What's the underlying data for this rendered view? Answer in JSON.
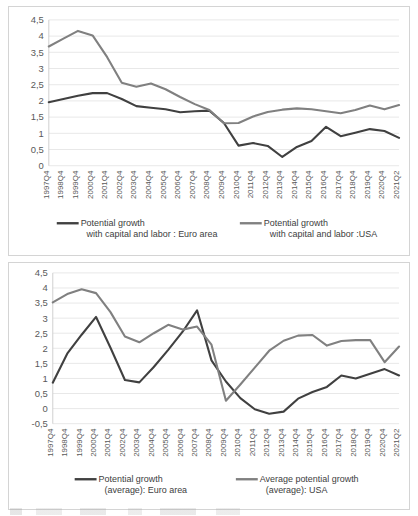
{
  "chart_data": [
    {
      "type": "line",
      "title": "",
      "xlabel": "",
      "ylabel": "",
      "ylim": [
        0,
        4.5
      ],
      "ytick_labels": [
        "0",
        "0,5",
        "1",
        "1,5",
        "2",
        "2,5",
        "3",
        "3,5",
        "4",
        "4,5"
      ],
      "ytick_values": [
        0,
        0.5,
        1,
        1.5,
        2,
        2.5,
        3,
        3.5,
        4,
        4.5
      ],
      "grid": true,
      "legend_position": "bottom",
      "categories": [
        "1997Q4",
        "1998Q4",
        "1999Q4",
        "2000Q4",
        "2001Q4",
        "2002Q4",
        "2003Q4",
        "2004Q4",
        "2005Q4",
        "2006Q4",
        "2007Q4",
        "2008Q4",
        "2009Q4",
        "2010Q4",
        "2011Q4",
        "2012Q4",
        "2013Q4",
        "2014Q4",
        "2015Q4",
        "2016Q4",
        "2017Q4",
        "2018Q4",
        "2019Q4",
        "2020Q4",
        "2021Q2"
      ],
      "series": [
        {
          "name": "Potential growth with capital and labor : Euro area",
          "legend_line1": "Potential growth",
          "legend_line2": "with capital and labor : Euro area",
          "color": "#404040",
          "values": [
            1.96,
            2.06,
            2.16,
            2.24,
            2.24,
            2.06,
            1.84,
            1.79,
            1.74,
            1.65,
            1.68,
            1.7,
            1.32,
            0.62,
            0.7,
            0.61,
            0.27,
            0.58,
            0.76,
            1.2,
            0.91,
            1.02,
            1.13,
            1.07,
            0.86
          ]
        },
        {
          "name": "Potential growth with capital and labor :USA",
          "legend_line1": "Potential growth",
          "legend_line2": "with capital and labor :USA",
          "color": "#808080",
          "values": [
            3.68,
            3.92,
            4.16,
            4.02,
            3.35,
            2.56,
            2.44,
            2.54,
            2.36,
            2.12,
            1.9,
            1.72,
            1.31,
            1.32,
            1.52,
            1.66,
            1.73,
            1.77,
            1.74,
            1.68,
            1.62,
            1.72,
            1.86,
            1.74,
            1.87
          ]
        }
      ]
    },
    {
      "type": "line",
      "title": "",
      "xlabel": "",
      "ylabel": "",
      "ylim": [
        -0.5,
        4.5
      ],
      "ytick_labels": [
        "-0,5",
        "0",
        "0,5",
        "1",
        "1,5",
        "2",
        "2,5",
        "3",
        "3,5",
        "4",
        "4,5"
      ],
      "ytick_values": [
        -0.5,
        0,
        0.5,
        1,
        1.5,
        2,
        2.5,
        3,
        3.5,
        4,
        4.5
      ],
      "grid": true,
      "legend_position": "bottom",
      "categories": [
        "1997Q4",
        "1998Q4",
        "1999Q4",
        "2000Q4",
        "2001Q4",
        "2002Q4",
        "2003Q4",
        "2004Q4",
        "2005Q4",
        "2006Q4",
        "2007Q4",
        "2008Q4",
        "2009Q4",
        "2010Q4",
        "2011Q4",
        "2012Q4",
        "2013Q4",
        "2014Q4",
        "2015Q4",
        "2016Q4",
        "2017Q4",
        "2018Q4",
        "2019Q4",
        "2020Q4",
        "2021Q2"
      ],
      "series": [
        {
          "name": "Potential growth (average): Euro area",
          "legend_line1": "Potential growth",
          "legend_line2": "(average): Euro area",
          "color": "#404040",
          "values": [
            0.86,
            1.82,
            2.45,
            3.04,
            2.02,
            0.95,
            0.87,
            1.38,
            1.95,
            2.55,
            3.26,
            1.6,
            0.9,
            0.35,
            -0.02,
            -0.17,
            -0.1,
            0.33,
            0.55,
            0.72,
            1.1,
            1.0,
            1.16,
            1.31,
            1.1
          ]
        },
        {
          "name": "Average potential growth (average): USA",
          "legend_line1": "Average potential growth",
          "legend_line2": "(average): USA",
          "color": "#808080",
          "values": [
            3.52,
            3.8,
            3.96,
            3.83,
            3.2,
            2.39,
            2.2,
            2.5,
            2.78,
            2.62,
            2.72,
            2.12,
            0.26,
            0.8,
            1.36,
            1.92,
            2.25,
            2.42,
            2.44,
            2.09,
            2.24,
            2.27,
            2.27,
            1.54,
            2.06
          ]
        }
      ]
    }
  ]
}
